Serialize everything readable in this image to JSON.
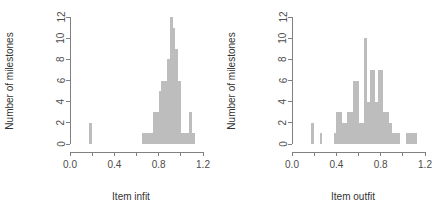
{
  "figure": {
    "background_color": "#ffffff",
    "panel_count": 2,
    "bar_fill_color": "#bdbdbd",
    "axis_color": "#808080",
    "text_color": "#333333"
  },
  "chart_data": [
    {
      "type": "bar",
      "id": "item-infit-histogram",
      "title": "",
      "xlabel": "Item infit",
      "ylabel": "Number of milestones",
      "xlim": [
        0.0,
        1.2
      ],
      "ylim": [
        0,
        12
      ],
      "xticks": [
        0.0,
        0.2,
        0.4,
        0.6,
        0.8,
        1.0,
        1.2
      ],
      "xtick_labels": [
        "0.0",
        "",
        "0.4",
        "",
        "0.8",
        "",
        "1.2"
      ],
      "yticks": [
        0,
        2,
        4,
        6,
        8,
        10,
        12
      ],
      "ytick_labels": [
        "0",
        "2",
        "4",
        "6",
        "8",
        "10",
        "12"
      ],
      "grid": false,
      "legend": false,
      "bin_width": 0.025,
      "bins": [
        {
          "x0": 0.175,
          "x1": 0.2,
          "count": 2
        },
        {
          "x0": 0.65,
          "x1": 0.675,
          "count": 1
        },
        {
          "x0": 0.675,
          "x1": 0.7,
          "count": 1
        },
        {
          "x0": 0.7,
          "x1": 0.725,
          "count": 1
        },
        {
          "x0": 0.725,
          "x1": 0.75,
          "count": 1
        },
        {
          "x0": 0.75,
          "x1": 0.775,
          "count": 3
        },
        {
          "x0": 0.775,
          "x1": 0.8,
          "count": 3
        },
        {
          "x0": 0.8,
          "x1": 0.825,
          "count": 5
        },
        {
          "x0": 0.825,
          "x1": 0.85,
          "count": 6
        },
        {
          "x0": 0.85,
          "x1": 0.875,
          "count": 6
        },
        {
          "x0": 0.875,
          "x1": 0.9,
          "count": 8
        },
        {
          "x0": 0.9,
          "x1": 0.925,
          "count": 12
        },
        {
          "x0": 0.925,
          "x1": 0.95,
          "count": 11
        },
        {
          "x0": 0.95,
          "x1": 0.975,
          "count": 9
        },
        {
          "x0": 0.975,
          "x1": 1.0,
          "count": 6
        },
        {
          "x0": 1.0,
          "x1": 1.025,
          "count": 1
        },
        {
          "x0": 1.025,
          "x1": 1.05,
          "count": 1
        },
        {
          "x0": 1.05,
          "x1": 1.075,
          "count": 1
        },
        {
          "x0": 1.075,
          "x1": 1.1,
          "count": 3
        },
        {
          "x0": 1.1,
          "x1": 1.125,
          "count": 1
        }
      ]
    },
    {
      "type": "bar",
      "id": "item-outfit-histogram",
      "title": "",
      "xlabel": "Item outfit",
      "ylabel": "Number of milestones",
      "xlim": [
        0.0,
        1.2
      ],
      "ylim": [
        0,
        12
      ],
      "xticks": [
        0.0,
        0.2,
        0.4,
        0.6,
        0.8,
        1.0,
        1.2
      ],
      "xtick_labels": [
        "0.0",
        "",
        "0.4",
        "",
        "0.8",
        "",
        "1.2"
      ],
      "yticks": [
        0,
        2,
        4,
        6,
        8,
        10,
        12
      ],
      "ytick_labels": [
        "0",
        "2",
        "4",
        "6",
        "8",
        "10",
        "12"
      ],
      "grid": false,
      "legend": false,
      "bin_width": 0.025,
      "bins": [
        {
          "x0": 0.175,
          "x1": 0.2,
          "count": 2
        },
        {
          "x0": 0.25,
          "x1": 0.275,
          "count": 1
        },
        {
          "x0": 0.375,
          "x1": 0.4,
          "count": 1
        },
        {
          "x0": 0.4,
          "x1": 0.425,
          "count": 3
        },
        {
          "x0": 0.425,
          "x1": 0.45,
          "count": 3
        },
        {
          "x0": 0.45,
          "x1": 0.475,
          "count": 2
        },
        {
          "x0": 0.475,
          "x1": 0.5,
          "count": 2
        },
        {
          "x0": 0.5,
          "x1": 0.525,
          "count": 3
        },
        {
          "x0": 0.525,
          "x1": 0.55,
          "count": 3
        },
        {
          "x0": 0.55,
          "x1": 0.575,
          "count": 6
        },
        {
          "x0": 0.575,
          "x1": 0.6,
          "count": 6
        },
        {
          "x0": 0.6,
          "x1": 0.625,
          "count": 2
        },
        {
          "x0": 0.625,
          "x1": 0.65,
          "count": 2
        },
        {
          "x0": 0.65,
          "x1": 0.675,
          "count": 10
        },
        {
          "x0": 0.675,
          "x1": 0.7,
          "count": 4
        },
        {
          "x0": 0.7,
          "x1": 0.725,
          "count": 7
        },
        {
          "x0": 0.725,
          "x1": 0.75,
          "count": 7
        },
        {
          "x0": 0.75,
          "x1": 0.775,
          "count": 4
        },
        {
          "x0": 0.775,
          "x1": 0.8,
          "count": 7
        },
        {
          "x0": 0.8,
          "x1": 0.825,
          "count": 7
        },
        {
          "x0": 0.825,
          "x1": 0.85,
          "count": 3
        },
        {
          "x0": 0.85,
          "x1": 0.875,
          "count": 3
        },
        {
          "x0": 0.875,
          "x1": 0.9,
          "count": 2
        },
        {
          "x0": 0.9,
          "x1": 0.925,
          "count": 1
        },
        {
          "x0": 0.925,
          "x1": 0.95,
          "count": 1
        },
        {
          "x0": 0.95,
          "x1": 0.975,
          "count": 1
        },
        {
          "x0": 1.025,
          "x1": 1.05,
          "count": 1
        },
        {
          "x0": 1.05,
          "x1": 1.075,
          "count": 1
        },
        {
          "x0": 1.075,
          "x1": 1.1,
          "count": 1
        },
        {
          "x0": 1.1,
          "x1": 1.125,
          "count": 1
        }
      ]
    }
  ]
}
